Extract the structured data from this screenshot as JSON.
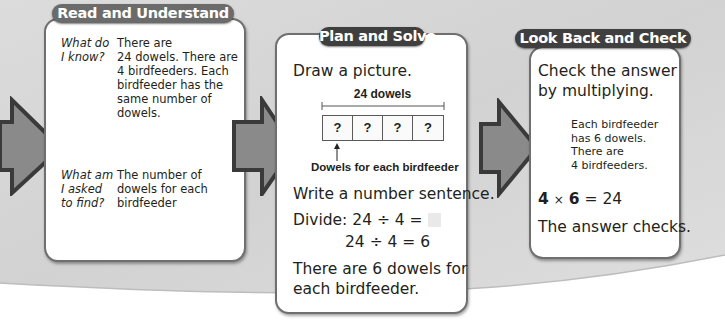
{
  "colors": {
    "pill_dark": "#3f3f3f",
    "pill_medium": "#6b6b6b",
    "arrow_fill": "#8a8a8a",
    "arrow_border": "#3a3a3a",
    "background_gray": "#d8d8d8",
    "panel_border": "#6f6f6f"
  },
  "read_and_understand": {
    "title": "Read and Understand",
    "question1_line1": "What do",
    "question1_line2": "I know?",
    "answer1_lines": [
      "There are",
      "24 dowels. There are",
      "4 birdfeeders. Each",
      "birdfeeder has the",
      "same number of",
      "dowels."
    ],
    "question2_line1": "What am",
    "question2_line2": "I asked",
    "question2_line3": "to find?",
    "answer2_lines": [
      "The number of",
      "dowels for each",
      "birdfeeder"
    ]
  },
  "plan_and_solve": {
    "title": "Plan and Solve",
    "instruction": "Draw a picture.",
    "diagram": {
      "total_label": "24 dowels",
      "boxes": [
        "?",
        "?",
        "?",
        "?"
      ],
      "pointer_label": "Dowels for each birdfeeder"
    },
    "write_sentence": "Write a number sentence.",
    "divide_label": "Divide:",
    "equation1": "24 ÷ 4 =",
    "equation2": "24 ÷ 4 = 6",
    "conclusion_line1": "There are 6 dowels for",
    "conclusion_line2": "each birdfeeder."
  },
  "look_back_and_check": {
    "title": "Look Back and Check",
    "instruction_line1": "Check the answer",
    "instruction_line2": "by multiplying.",
    "note_lines": [
      "Each birdfeeder",
      "has 6 dowels.",
      "There are",
      "4 birdfeeders."
    ],
    "eq_factor1": "4",
    "eq_times": "×",
    "eq_factor2": "6",
    "eq_rest": "= 24",
    "result": "The answer checks."
  },
  "icons": {
    "arrow1": "right-arrow-icon",
    "arrow2": "right-arrow-icon",
    "arrow3": "right-arrow-icon",
    "pointer": "up-arrow-icon"
  }
}
